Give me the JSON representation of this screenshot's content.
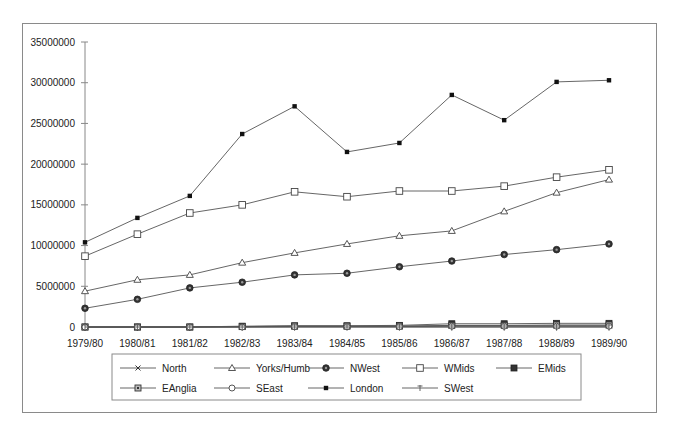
{
  "chart_data": {
    "type": "line",
    "title": "",
    "xlabel": "",
    "ylabel": "",
    "ylim": [
      0,
      35000000
    ],
    "yticks": [
      0,
      5000000,
      10000000,
      15000000,
      20000000,
      25000000,
      30000000,
      35000000
    ],
    "ytick_labels": [
      "0",
      "5000000",
      "10000000",
      "15000000",
      "20000000",
      "25000000",
      "30000000",
      "35000000"
    ],
    "grid": false,
    "legend_position": "bottom",
    "categories": [
      "1979/80",
      "1980/81",
      "1981/82",
      "1982/83",
      "1983/84",
      "1984/85",
      "1985/86",
      "1986/87",
      "1987/88",
      "1988/89",
      "1989/90"
    ],
    "series": [
      {
        "name": "North",
        "marker": "x",
        "values": [
          0,
          0,
          0,
          50000,
          100000,
          100000,
          100000,
          150000,
          150000,
          150000,
          150000
        ]
      },
      {
        "name": "Yorks/Humb",
        "marker": "triangle-open",
        "values": [
          4400000,
          5800000,
          6400000,
          7900000,
          9100000,
          10200000,
          11200000,
          11800000,
          14200000,
          16500000,
          18100000
        ]
      },
      {
        "name": "NWest",
        "marker": "circle-dark",
        "values": [
          2300000,
          3400000,
          4800000,
          5500000,
          6400000,
          6600000,
          7400000,
          8100000,
          8900000,
          9500000,
          10200000
        ]
      },
      {
        "name": "WMids",
        "marker": "square-open",
        "values": [
          8700000,
          11400000,
          14000000,
          15000000,
          16600000,
          16000000,
          16700000,
          16700000,
          17300000,
          18400000,
          19300000
        ]
      },
      {
        "name": "EMids",
        "marker": "square-filled",
        "values": [
          0,
          0,
          0,
          100000,
          150000,
          150000,
          200000,
          400000,
          400000,
          450000,
          450000
        ]
      },
      {
        "name": "EAnglia",
        "marker": "square-dotted",
        "values": [
          0,
          0,
          0,
          50000,
          100000,
          100000,
          100000,
          200000,
          200000,
          250000,
          250000
        ]
      },
      {
        "name": "SEast",
        "marker": "circle-open",
        "values": [
          0,
          0,
          0,
          0,
          50000,
          50000,
          50000,
          100000,
          100000,
          100000,
          100000
        ]
      },
      {
        "name": "London",
        "marker": "square-small-filled",
        "values": [
          10400000,
          13400000,
          16100000,
          23700000,
          27100000,
          21500000,
          22600000,
          28500000,
          25400000,
          30100000,
          30300000
        ]
      },
      {
        "name": "SWest",
        "marker": "plus",
        "values": [
          0,
          0,
          0,
          0,
          0,
          0,
          0,
          0,
          0,
          0,
          0
        ]
      }
    ]
  },
  "legend": {
    "items": [
      {
        "label": "North",
        "marker": "x"
      },
      {
        "label": "Yorks/Humb",
        "marker": "triangle-open"
      },
      {
        "label": "NWest",
        "marker": "circle-dark"
      },
      {
        "label": "WMids",
        "marker": "square-open"
      },
      {
        "label": "EMids",
        "marker": "square-filled"
      },
      {
        "label": "EAnglia",
        "marker": "square-dotted"
      },
      {
        "label": "SEast",
        "marker": "circle-open"
      },
      {
        "label": "London",
        "marker": "square-small-filled"
      },
      {
        "label": "SWest",
        "marker": "plus"
      }
    ]
  },
  "colors": {
    "line": "#555555",
    "frame": "#8a8a8a",
    "axis": "#888888",
    "text": "#222222"
  }
}
